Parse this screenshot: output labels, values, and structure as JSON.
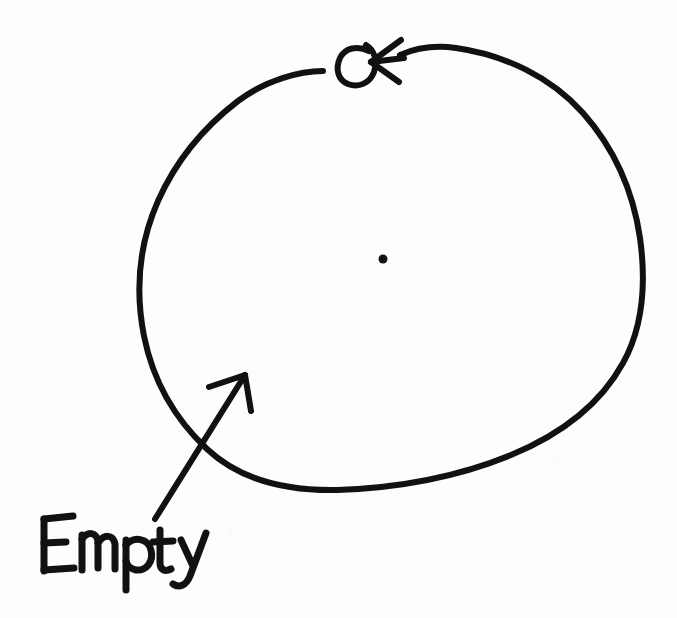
{
  "canvas": {
    "width": 677,
    "height": 618,
    "background_color": "#fdfdfd",
    "ink_color": "#111111",
    "medium": "black marker on white paper",
    "style": "hand-drawn sketch"
  },
  "shapes": {
    "circle": {
      "name": "large hand-drawn circle",
      "interior_state": "empty",
      "stroke_width": 6,
      "bounds": {
        "x_min": 137,
        "x_max": 644,
        "y_min": 45,
        "y_max": 492
      },
      "center": {
        "x": 390,
        "y": 268
      },
      "has_gap_at_top": true,
      "gap": {
        "x_start": 323,
        "x_end": 340,
        "y": 71
      },
      "path": "M 323 71 C 300 71 266 80 238 101 C 208 124 178 156 158 201 C 139 244 135 290 144 336 C 153 381 175 419 207 449 C 241 481 287 491 337 490 C 395 488 455 478 511 455 C 562 434 601 403 623 363 C 644 325 646 281 640 238 C 633 190 613 147 583 113 C 551 77 505 55 456 48 C 434 45 416 48 400 55"
    },
    "direction_loop": {
      "name": "pen loop curl at top of circle",
      "description": "small counterclockwise e-shaped curl where the stroke crosses itself before the arrowhead",
      "stroke_width": 6,
      "bounds": {
        "x_min": 338,
        "x_max": 374,
        "y_min": 47,
        "y_max": 85
      },
      "path": "M 369 51 C 357 45 345 48 340 58 C 335 69 338 80 348 84 C 359 88 370 83 374 72 C 378 60 374 50 366 45"
    },
    "direction_arrowhead": {
      "name": "arrowhead indicating counterclockwise travel",
      "points_toward": "left",
      "apex": {
        "x": 371,
        "y": 62
      },
      "stroke_width": 6,
      "barb_upper": "M 371 62 L 401 40",
      "barb_lower": "M 371 62 L 399 82",
      "tail": "M 371 62 L 404 58"
    },
    "center_dot": {
      "name": "small dot at circle center",
      "x": 383,
      "y": 259,
      "radius": 4.5
    },
    "label_arrow": {
      "name": "arrow from label into circle interior",
      "description": "straight shaft running from the Empty label up and to the right, crossing the circle outline and ending inside it",
      "stroke_width": 6,
      "tail": {
        "x": 155,
        "y": 519
      },
      "tip": {
        "x": 245,
        "y": 375
      },
      "crosses_circle_at": {
        "x": 222,
        "y": 425
      },
      "shaft": "M 155 519 L 245 375",
      "barb_left": "M 245 375 L 209 387",
      "barb_right": "M 245 375 L 251 411"
    }
  },
  "labels": {
    "empty": {
      "text": "Empty",
      "x": 38,
      "y": 515,
      "width": 122,
      "height": 56,
      "handwriting": true
    }
  },
  "glyphs": {
    "empty_strokes": [
      "M 44 519 L 44 571",
      "M 44 519 L 73 516",
      "M 44 543 L 66 542",
      "M 44 570 L 74 568",
      "M 82 535 L 82 570",
      "M 82 539 C 88 531 96 532 98 541 L 98 568",
      "M 98 543 C 104 534 113 534 115 544 L 115 569",
      "M 126 540 L 126 590",
      "M 126 545 C 134 536 148 538 151 550 C 154 562 146 571 136 570 C 131 569 127 565 126 561",
      "M 160 530 L 160 563 C 160 570 165 572 171 569",
      "M 153 542 L 173 541",
      "M 181 540 L 193 566",
      "M 206 533 L 190 576 C 186 586 179 588 173 584"
    ]
  }
}
